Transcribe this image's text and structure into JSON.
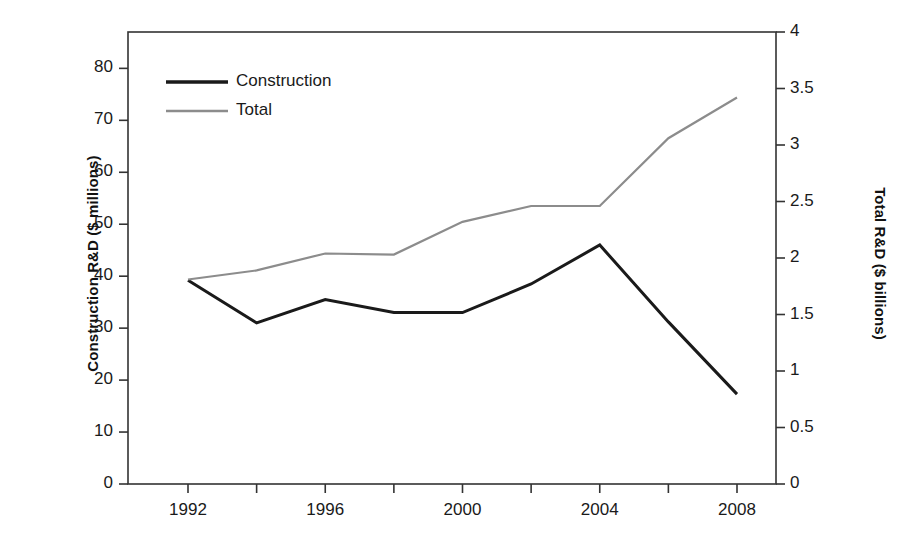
{
  "chart_data": {
    "type": "line",
    "title": "",
    "subtitle": "",
    "xlabel": "",
    "ylabel": "Construction R&D ($ millions)",
    "y2label": "Total R&D ($ billions)",
    "grid": false,
    "legend_position": "top-left",
    "x": [
      1992,
      1994,
      1996,
      1998,
      2000,
      2002,
      2004,
      2006,
      2008
    ],
    "xlim": [
      1991,
      2009
    ],
    "x_tick_values": [
      1992,
      1994,
      1996,
      1998,
      2000,
      2002,
      2004,
      2006,
      2008
    ],
    "x_tick_labels": [
      "1992",
      "",
      "1996",
      "",
      "2000",
      "",
      "2004",
      "",
      "2008"
    ],
    "x_major_labels": [
      "1992",
      "1996",
      "2000",
      "2004",
      "2008"
    ],
    "ylim": [
      0,
      87
    ],
    "y_tick_values": [
      0,
      10,
      20,
      30,
      40,
      50,
      60,
      70,
      80
    ],
    "y_tick_labels": [
      "0",
      "10",
      "20",
      "30",
      "40",
      "50",
      "60",
      "70",
      "80"
    ],
    "y2lim": [
      0,
      4
    ],
    "y2_tick_values": [
      0,
      0.5,
      1,
      1.5,
      2,
      2.5,
      3,
      3.5,
      4
    ],
    "y2_tick_labels": [
      "0",
      "0.5",
      "1",
      "1.5",
      "2",
      "2.5",
      "3",
      "3.5",
      "4"
    ],
    "series": [
      {
        "name": "Construction",
        "axis": "left",
        "units": "$ millions",
        "color": "#1a1a1a",
        "values": [
          39.2,
          31.0,
          35.5,
          33.0,
          33.0,
          38.5,
          46.0,
          31.2,
          17.3
        ]
      },
      {
        "name": "Total",
        "axis": "right",
        "units": "$ billions",
        "color": "#8c8c8c",
        "values": [
          1.81,
          1.89,
          2.04,
          2.03,
          2.32,
          2.46,
          2.46,
          3.06,
          3.42
        ],
        "values_in_left_units": [
          39.3,
          41.1,
          44.6,
          44.3,
          50.4,
          53.5,
          53.6,
          66.5,
          74.2
        ]
      }
    ],
    "legend": [
      {
        "label": "Construction",
        "color": "#1a1a1a"
      },
      {
        "label": "Total",
        "color": "#8c8c8c"
      }
    ]
  }
}
